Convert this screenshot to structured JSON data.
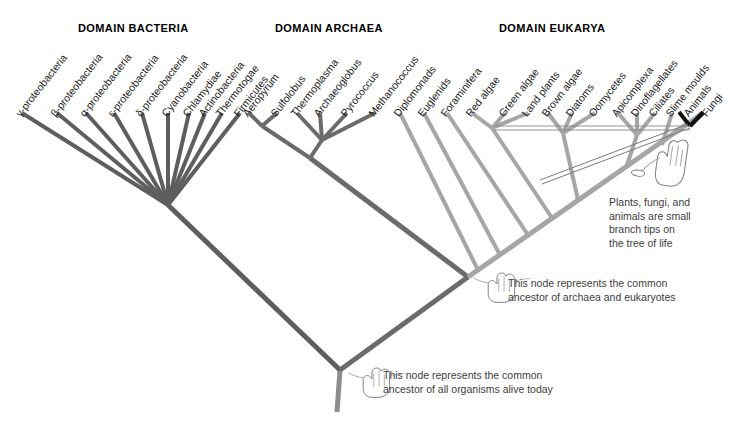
{
  "figure": {
    "type": "phylogenetic-tree",
    "background_color": "#ffffff",
    "colors": {
      "bacteria_branch": "#5e5e5e",
      "archaea_branch": "#6b6b6b",
      "eukarya_branch": "#a6a6a6",
      "highlight_black": "#121212",
      "trunk": "#8d8d8d",
      "label_text": "#1a1a1a",
      "annotation_text": "#3d3d3d",
      "title_text": "#000000"
    }
  },
  "domains": [
    {
      "id": "bacteria",
      "title": "DOMAIN BACTERIA"
    },
    {
      "id": "archaea",
      "title": "DOMAIN ARCHAEA"
    },
    {
      "id": "eukarya",
      "title": "DOMAIN EUKARYA"
    }
  ],
  "tips": {
    "bacteria": [
      "γ-proteobacteria",
      "β-proteobacteria",
      "α-proteobacteria",
      "ε-proteobacteria",
      "δ-proteobacteria",
      "Cyanobacteria",
      "Chlamydiae",
      "Actinobacteria",
      "Thermotogae",
      "Firmicutes"
    ],
    "archaea": [
      "Aeropyrum",
      "Sulfolobus",
      "Thermoplasma",
      "Archaeoglobus",
      "Pyrococcus",
      "Methanococcus"
    ],
    "eukarya": [
      "Diplomonads",
      "Euglenids",
      "Foraminifera",
      "Red algae",
      "Green algae",
      "Land plants",
      "Brown algae",
      "Diatoms",
      "Oomycetes",
      "Apicomplexa",
      "Dinoflagellates",
      "Ciliates",
      "Slime moulds",
      "Animals",
      "Fungi"
    ]
  },
  "annotations": [
    {
      "id": "branch-tips",
      "text": "Plants, fungi, and\nanimals are small\nbranch tips on\nthe tree of life"
    },
    {
      "id": "archaea-eukaryote-ancestor",
      "text": "This node represents the common\nancestor of archaea and eukaryotes"
    },
    {
      "id": "universal-ancestor",
      "text": "This node represents the common\nancestor of all organisms alive today"
    }
  ]
}
